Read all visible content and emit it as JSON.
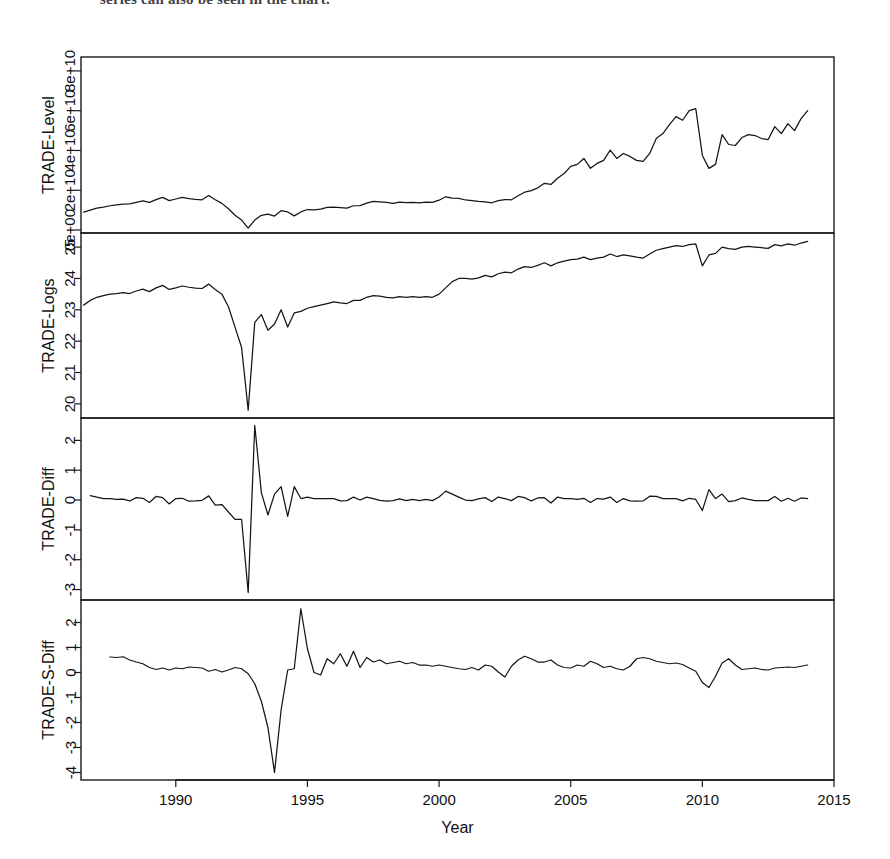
{
  "figure": {
    "top_cut_text": "series can also be seen in the chart.",
    "xlabel": "Year",
    "x_ticks": [
      "1990",
      "1995",
      "2000",
      "2005",
      "2010",
      "2015"
    ],
    "x_tick_values": [
      1990,
      1995,
      2000,
      2005,
      2010,
      2015
    ],
    "xlim": [
      1986.4,
      2015.0
    ],
    "line_color": "#151515",
    "axis_color": "#1a1a1a",
    "background": "#ffffff"
  },
  "chart_data": [
    {
      "type": "line",
      "title": "",
      "ylabel": "TRADE-Level",
      "xlabel": "Year",
      "ylim": [
        -1500000000.0,
        87000000000
      ],
      "xlim": [
        1986.4,
        2015.0
      ],
      "grid": false,
      "legend": "none",
      "y_ticks": [
        "0e+00",
        "2e+10",
        "4e+10",
        "6e+10",
        "8e+10"
      ],
      "y_tick_values": [
        0,
        20000000000,
        40000000000,
        60000000000,
        80000000000
      ],
      "x": [
        1986.5,
        1986.75,
        1987,
        1987.25,
        1987.5,
        1987.75,
        1988,
        1988.25,
        1988.5,
        1988.75,
        1989,
        1989.25,
        1989.5,
        1989.75,
        1990,
        1990.25,
        1990.5,
        1990.75,
        1991,
        1991.25,
        1991.5,
        1991.75,
        1992,
        1992.25,
        1992.5,
        1992.75,
        1993,
        1993.25,
        1993.5,
        1993.75,
        1994,
        1994.25,
        1994.5,
        1994.75,
        1995,
        1995.25,
        1995.5,
        1995.75,
        1996,
        1996.25,
        1996.5,
        1996.75,
        1997,
        1997.25,
        1997.5,
        1997.75,
        1998,
        1998.25,
        1998.5,
        1998.75,
        1999,
        1999.25,
        1999.5,
        1999.75,
        2000,
        2000.25,
        2000.5,
        2000.75,
        2001,
        2001.25,
        2001.5,
        2001.75,
        2002,
        2002.25,
        2002.5,
        2002.75,
        2003,
        2003.25,
        2003.5,
        2003.75,
        2004,
        2004.25,
        2004.5,
        2004.75,
        2005,
        2005.25,
        2005.5,
        2005.75,
        2006,
        2006.25,
        2006.5,
        2006.75,
        2007,
        2007.25,
        2007.5,
        2007.75,
        2008,
        2008.25,
        2008.5,
        2008.75,
        2009,
        2009.25,
        2009.5,
        2009.75,
        2010,
        2010.25,
        2010.5,
        2010.75,
        2011,
        2011.25,
        2011.5,
        2011.75,
        2012,
        2012.25,
        2012.5,
        2012.75,
        2013,
        2013.25,
        2013.5,
        2013.75,
        2014
      ],
      "values": [
        9000000000.0,
        10000000000.0,
        11000000000.0,
        11500000000.0,
        12200000000.0,
        12600000000.0,
        13000000000.0,
        13100000000.0,
        13900000000.0,
        14600000000.0,
        13900000000.0,
        15300000000.0,
        16400000000.0,
        14800000000.0,
        15600000000.0,
        16400000000.0,
        15800000000.0,
        15400000000.0,
        15200000000.0,
        17400000000.0,
        15200000000.0,
        13400000000.0,
        10700000000.0,
        7400000000.0,
        5000000000.0,
        1000000000.0,
        5000000000.0,
        7400000000.0,
        8000000000.0,
        7000000000.0,
        9700000000.0,
        9100000000.0,
        7100000000.0,
        9100000000.0,
        10300000000.0,
        10100000000.0,
        10500000000.0,
        11400000000.0,
        11500000000.0,
        11300000000.0,
        11000000000.0,
        12200000000.0,
        12300000000.0,
        13500000000.0,
        14400000000.0,
        14200000000.0,
        13900000000.0,
        13400000000.0,
        14000000000.0,
        13800000000.0,
        13900000000.0,
        13700000000.0,
        14000000000.0,
        13900000000.0,
        15000000000.0,
        16700000000.0,
        16000000000.0,
        15900000000.0,
        15100000000.0,
        14800000000.0,
        14400000000.0,
        14100000000.0,
        13700000000.0,
        14800000000.0,
        15300000000.0,
        15200000000.0,
        17200000000.0,
        19000000000.0,
        19800000000.0,
        21200000000.0,
        23500000000.0,
        22900000000.0,
        26000000000.0,
        28400000000.0,
        32000000000.0,
        33000000000.0,
        36000000000.0,
        31000000000.0,
        33500000000.0,
        35000000000.0,
        40200000000.0,
        36000000000.0,
        38500000000.0,
        37000000000.0,
        35000000000.0,
        34500000000.0,
        38500000000.0,
        46000000000.0,
        48500000000.0,
        53000000000.0,
        57000000000.0,
        55200000000.0,
        60000000000.0,
        61000000000.0,
        37500000000.0,
        31000000000.0,
        33000000000.0,
        48000000000.0,
        43000000000.0,
        42500000000.0,
        46500000000.0,
        48000000000.0,
        47500000000.0,
        46000000000.0,
        45500000000.0,
        52000000000.0,
        48500000000.0,
        53500000000.0,
        50000000000.0,
        56000000000.0,
        60000000000.0,
        55500000000.0,
        62000000000.0,
        63000000000.0
      ]
    },
    {
      "type": "line",
      "title": "",
      "ylabel": "TRADE-Logs",
      "xlabel": "Year",
      "ylim": [
        19.55,
        25.45
      ],
      "xlim": [
        1986.4,
        2015.0
      ],
      "grid": false,
      "legend": "none",
      "y_ticks": [
        "20",
        "21",
        "22",
        "23",
        "24",
        "25"
      ],
      "y_tick_values": [
        20,
        21,
        22,
        23,
        24,
        25
      ],
      "x": [
        1986.5,
        1986.75,
        1987,
        1987.25,
        1987.5,
        1987.75,
        1988,
        1988.25,
        1988.5,
        1988.75,
        1989,
        1989.25,
        1989.5,
        1989.75,
        1990,
        1990.25,
        1990.5,
        1990.75,
        1991,
        1991.25,
        1991.5,
        1991.75,
        1992,
        1992.25,
        1992.5,
        1992.75,
        1993,
        1993.25,
        1993.5,
        1993.75,
        1994,
        1994.25,
        1994.5,
        1994.75,
        1995,
        1995.25,
        1995.5,
        1995.75,
        1996,
        1996.25,
        1996.5,
        1996.75,
        1997,
        1997.25,
        1997.5,
        1997.75,
        1998,
        1998.25,
        1998.5,
        1998.75,
        1999,
        1999.25,
        1999.5,
        1999.75,
        2000,
        2000.25,
        2000.5,
        2000.75,
        2001,
        2001.25,
        2001.5,
        2001.75,
        2002,
        2002.25,
        2002.5,
        2002.75,
        2003,
        2003.25,
        2003.5,
        2003.75,
        2004,
        2004.25,
        2004.5,
        2004.75,
        2005,
        2005.25,
        2005.5,
        2005.75,
        2006,
        2006.25,
        2006.5,
        2006.75,
        2007,
        2007.25,
        2007.5,
        2007.75,
        2008,
        2008.25,
        2008.5,
        2008.75,
        2009,
        2009.25,
        2009.5,
        2009.75,
        2010,
        2010.25,
        2010.5,
        2010.75,
        2011,
        2011.25,
        2011.5,
        2011.75,
        2012,
        2012.25,
        2012.5,
        2012.75,
        2013,
        2013.25,
        2013.5,
        2013.75,
        2014
      ],
      "values": [
        23.15,
        23.3,
        23.4,
        23.45,
        23.5,
        23.52,
        23.55,
        23.52,
        23.6,
        23.66,
        23.58,
        23.7,
        23.78,
        23.65,
        23.7,
        23.76,
        23.72,
        23.69,
        23.68,
        23.82,
        23.65,
        23.5,
        23.1,
        22.45,
        21.8,
        19.8,
        22.6,
        22.85,
        22.35,
        22.55,
        23.0,
        22.45,
        22.9,
        22.95,
        23.05,
        23.1,
        23.15,
        23.2,
        23.25,
        23.22,
        23.2,
        23.3,
        23.3,
        23.4,
        23.45,
        23.44,
        23.4,
        23.38,
        23.42,
        23.4,
        23.42,
        23.4,
        23.42,
        23.4,
        23.5,
        23.7,
        23.9,
        24.0,
        24.0,
        23.98,
        24.02,
        24.1,
        24.05,
        24.15,
        24.2,
        24.18,
        24.3,
        24.38,
        24.35,
        24.42,
        24.5,
        24.4,
        24.5,
        24.55,
        24.6,
        24.62,
        24.68,
        24.6,
        24.65,
        24.68,
        24.78,
        24.7,
        24.75,
        24.72,
        24.68,
        24.65,
        24.78,
        24.9,
        24.95,
        25.0,
        25.05,
        25.02,
        25.08,
        25.1,
        24.4,
        24.75,
        24.8,
        25.0,
        24.95,
        24.93,
        25.0,
        25.02,
        25.0,
        24.98,
        24.96,
        25.08,
        25.04,
        25.1,
        25.06,
        25.13,
        25.18,
        25.14,
        25.2,
        25.22
      ]
    },
    {
      "type": "line",
      "title": "",
      "ylabel": "TRADE-Diff",
      "xlabel": "Year",
      "ylim": [
        -3.35,
        2.75
      ],
      "xlim": [
        1986.4,
        2015.0
      ],
      "grid": false,
      "legend": "none",
      "y_ticks": [
        "-3",
        "-2",
        "-1",
        "0",
        "1",
        "2"
      ],
      "y_tick_values": [
        -3,
        -2,
        -1,
        0,
        1,
        2
      ],
      "x": [
        1986.75,
        1987,
        1987.25,
        1987.5,
        1987.75,
        1988,
        1988.25,
        1988.5,
        1988.75,
        1989,
        1989.25,
        1989.5,
        1989.75,
        1990,
        1990.25,
        1990.5,
        1990.75,
        1991,
        1991.25,
        1991.5,
        1991.75,
        1992,
        1992.25,
        1992.5,
        1992.75,
        1993,
        1993.25,
        1993.5,
        1993.75,
        1994,
        1994.25,
        1994.5,
        1994.75,
        1995,
        1995.25,
        1995.5,
        1995.75,
        1996,
        1996.25,
        1996.5,
        1996.75,
        1997,
        1997.25,
        1997.5,
        1997.75,
        1998,
        1998.25,
        1998.5,
        1998.75,
        1999,
        1999.25,
        1999.5,
        1999.75,
        2000,
        2000.25,
        2000.5,
        2000.75,
        2001,
        2001.25,
        2001.5,
        2001.75,
        2002,
        2002.25,
        2002.5,
        2002.75,
        2003,
        2003.25,
        2003.5,
        2003.75,
        2004,
        2004.25,
        2004.5,
        2004.75,
        2005,
        2005.25,
        2005.5,
        2005.75,
        2006,
        2006.25,
        2006.5,
        2006.75,
        2007,
        2007.25,
        2007.5,
        2007.75,
        2008,
        2008.25,
        2008.5,
        2008.75,
        2009,
        2009.25,
        2009.5,
        2009.75,
        2010,
        2010.25,
        2010.5,
        2010.75,
        2011,
        2011.25,
        2011.5,
        2011.75,
        2012,
        2012.25,
        2012.5,
        2012.75,
        2013,
        2013.25,
        2013.5,
        2013.75,
        2014
      ],
      "values": [
        0.15,
        0.1,
        0.05,
        0.05,
        0.02,
        0.03,
        -0.03,
        0.08,
        0.06,
        -0.08,
        0.12,
        0.08,
        -0.13,
        0.05,
        0.06,
        -0.04,
        -0.03,
        -0.01,
        0.14,
        -0.17,
        -0.15,
        -0.4,
        -0.65,
        -0.65,
        -3.1,
        2.5,
        0.25,
        -0.5,
        0.2,
        0.45,
        -0.55,
        0.45,
        0.05,
        0.1,
        0.05,
        0.05,
        0.05,
        0.05,
        -0.03,
        -0.02,
        0.1,
        0.0,
        0.1,
        0.05,
        -0.01,
        -0.04,
        -0.02,
        0.04,
        -0.02,
        0.02,
        -0.02,
        0.02,
        -0.02,
        0.1,
        0.3,
        0.2,
        0.1,
        0.0,
        -0.02,
        0.04,
        0.08,
        -0.05,
        0.1,
        0.05,
        -0.02,
        0.12,
        0.08,
        -0.03,
        0.07,
        0.08,
        -0.1,
        0.1,
        0.05,
        0.05,
        0.02,
        0.06,
        -0.08,
        0.05,
        0.03,
        0.1,
        -0.08,
        0.05,
        -0.03,
        -0.04,
        -0.03,
        0.13,
        0.12,
        0.05,
        0.05,
        0.05,
        -0.03,
        0.06,
        0.02,
        -0.35,
        0.35,
        0.05,
        0.2,
        -0.05,
        -0.02,
        0.07,
        0.02,
        -0.02,
        -0.02,
        -0.02,
        0.12,
        -0.04,
        0.06,
        -0.04,
        0.07,
        0.05,
        -0.04,
        0.06,
        0.02
      ]
    },
    {
      "type": "line",
      "title": "",
      "ylabel": "TRADE-S-Diff",
      "xlabel": "Year",
      "ylim": [
        -4.3,
        2.9
      ],
      "xlim": [
        1986.4,
        2015.0
      ],
      "grid": false,
      "legend": "none",
      "y_ticks": [
        "-4",
        "-3",
        "-2",
        "-1",
        "0",
        "1",
        "2"
      ],
      "y_tick_values": [
        -4,
        -3,
        -2,
        -1,
        0,
        1,
        2
      ],
      "x": [
        1987.5,
        1987.75,
        1988,
        1988.25,
        1988.5,
        1988.75,
        1989,
        1989.25,
        1989.5,
        1989.75,
        1990,
        1990.25,
        1990.5,
        1990.75,
        1991,
        1991.25,
        1991.5,
        1991.75,
        1992,
        1992.25,
        1992.5,
        1992.75,
        1993,
        1993.25,
        1993.5,
        1993.75,
        1994,
        1994.25,
        1994.5,
        1994.75,
        1995,
        1995.25,
        1995.5,
        1995.75,
        1996,
        1996.25,
        1996.5,
        1996.75,
        1997,
        1997.25,
        1997.5,
        1997.75,
        1998,
        1998.25,
        1998.5,
        1998.75,
        1999,
        1999.25,
        1999.5,
        1999.75,
        2000,
        2000.25,
        2000.5,
        2000.75,
        2001,
        2001.25,
        2001.5,
        2001.75,
        2002,
        2002.25,
        2002.5,
        2002.75,
        2003,
        2003.25,
        2003.5,
        2003.75,
        2004,
        2004.25,
        2004.5,
        2004.75,
        2005,
        2005.25,
        2005.5,
        2005.75,
        2006,
        2006.25,
        2006.5,
        2006.75,
        2007,
        2007.25,
        2007.5,
        2007.75,
        2008,
        2008.25,
        2008.5,
        2008.75,
        2009,
        2009.25,
        2009.5,
        2009.75,
        2010,
        2010.25,
        2010.5,
        2010.75,
        2011,
        2011.25,
        2011.5,
        2011.75,
        2012,
        2012.25,
        2012.5,
        2012.75,
        2013,
        2013.25,
        2013.5,
        2013.75,
        2014
      ],
      "values": [
        0.62,
        0.6,
        0.63,
        0.5,
        0.42,
        0.35,
        0.2,
        0.12,
        0.18,
        0.1,
        0.18,
        0.15,
        0.22,
        0.2,
        0.18,
        0.05,
        0.12,
        0.02,
        0.1,
        0.2,
        0.15,
        -0.05,
        -0.45,
        -1.15,
        -2.2,
        -4.0,
        -1.5,
        0.1,
        0.15,
        2.55,
        0.95,
        0.0,
        -0.1,
        0.55,
        0.35,
        0.75,
        0.25,
        0.85,
        0.2,
        0.6,
        0.42,
        0.5,
        0.35,
        0.4,
        0.45,
        0.35,
        0.4,
        0.3,
        0.3,
        0.25,
        0.3,
        0.25,
        0.2,
        0.15,
        0.12,
        0.2,
        0.1,
        0.3,
        0.25,
        0.02,
        -0.18,
        0.25,
        0.5,
        0.65,
        0.55,
        0.42,
        0.42,
        0.5,
        0.3,
        0.2,
        0.18,
        0.3,
        0.25,
        0.45,
        0.35,
        0.2,
        0.25,
        0.15,
        0.1,
        0.25,
        0.55,
        0.6,
        0.55,
        0.45,
        0.4,
        0.35,
        0.38,
        0.32,
        0.18,
        0.05,
        -0.4,
        -0.6,
        -0.15,
        0.38,
        0.55,
        0.3,
        0.12,
        0.15,
        0.18,
        0.12,
        0.1,
        0.18,
        0.2,
        0.22,
        0.2,
        0.25,
        0.3,
        0.22,
        0.25
      ]
    }
  ]
}
